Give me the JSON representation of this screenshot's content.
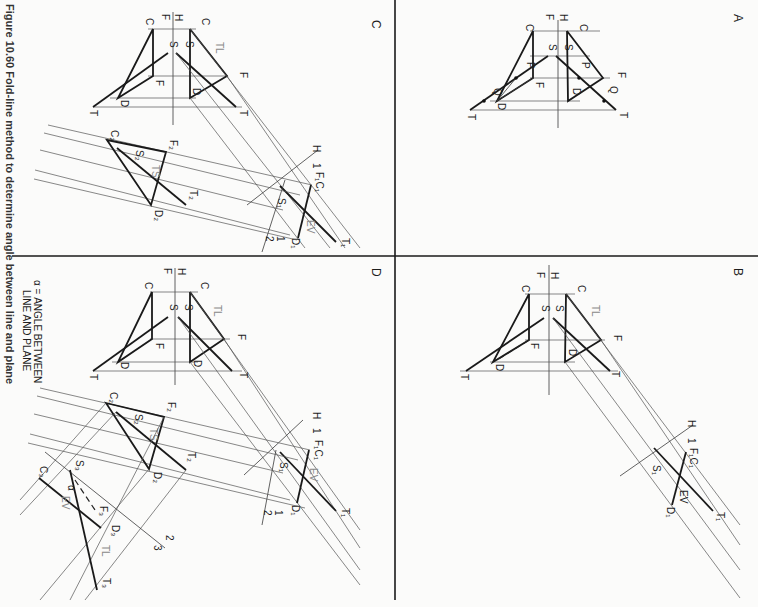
{
  "figure": {
    "caption": "Figure 10.60  Fold-line method to determine angle between line and plane",
    "orientation": "rotated 90° clockwise",
    "note_line1": "α = ANGLE BETWEEN",
    "note_line2": "LINE AND PLANE"
  },
  "panels": {
    "A": {
      "letter": "A",
      "fold": {
        "h": "H",
        "f": "F"
      },
      "labels": {
        "ct": "C",
        "cf": "C",
        "st": "S",
        "sf": "S",
        "ft": "F",
        "ff": "F",
        "dt": "D",
        "df": "D",
        "tt": "T",
        "tf": "T",
        "pt": "P",
        "pf": "P",
        "qt": "Q",
        "qf": "Q"
      },
      "subs": {
        "t": "T",
        "f": "F"
      }
    },
    "B": {
      "letter": "B",
      "fold": {
        "h": "H",
        "f": "F",
        "h1": "H",
        "one": "1"
      },
      "labels": {
        "ct": "C",
        "cf": "C",
        "st": "S",
        "sf": "S",
        "ft": "F",
        "ff": "F",
        "dt": "D",
        "df": "D",
        "tt": "T",
        "tf": "T",
        "f1c1": "F₁C₁",
        "s1": "S₁",
        "d1": "D₁",
        "t1": "T₁",
        "tl": "TL",
        "ev": "EV"
      },
      "subs": {
        "t": "T",
        "f": "F"
      }
    },
    "C": {
      "letter": "C",
      "fold": {
        "h": "H",
        "f": "F",
        "h1": "H",
        "one": "1",
        "one_b": "1",
        "two": "2"
      },
      "labels": {
        "ct": "C",
        "cf": "C",
        "st": "S",
        "sf": "S",
        "ft": "F",
        "ff": "F",
        "dt": "D",
        "df": "D",
        "tt": "T",
        "tf": "T",
        "f1c1": "F₁C₁",
        "s1": "S₁",
        "d1": "D₁",
        "t1": "T₁",
        "c2": "C₂",
        "f2": "F₂",
        "s2": "S₂",
        "d2": "D₂",
        "t2": "T₂",
        "tl": "TL",
        "ev": "EV",
        "ts": "TS"
      },
      "subs": {
        "t": "T",
        "f": "F"
      }
    },
    "D": {
      "letter": "D",
      "fold": {
        "h": "H",
        "f": "F",
        "h1": "H",
        "one": "1",
        "one_b": "1",
        "two": "2",
        "two_b": "2",
        "three": "3"
      },
      "labels": {
        "ct": "C",
        "cf": "C",
        "st": "S",
        "sf": "S",
        "ft": "F",
        "ff": "F",
        "dt": "D",
        "df": "D",
        "tt": "T",
        "tf": "T",
        "f1c1": "F₁C₁",
        "s1": "S₁",
        "d1": "D₁",
        "t1": "T₁",
        "c2": "C₂",
        "f2": "F₂",
        "s2": "S₂",
        "d2": "D₂",
        "t2": "T₂",
        "c3": "C₃",
        "s3": "S₃",
        "f3": "F₃",
        "d3": "D₃",
        "t3": "T₃",
        "tl": "TL",
        "ev": "EV",
        "ts": "TS",
        "alpha": "α",
        "ev3": "EV",
        "tl3": "TL"
      },
      "subs": {
        "t": "T",
        "f": "F"
      }
    }
  }
}
